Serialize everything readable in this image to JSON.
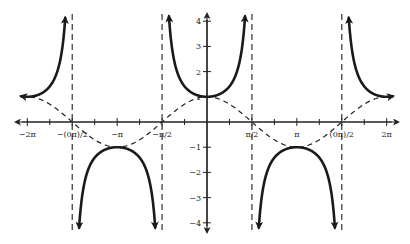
{
  "chart_data": {
    "type": "line",
    "title": "",
    "xlabel": "",
    "ylabel": "",
    "xlim": [
      -6.5,
      6.5
    ],
    "ylim": [
      -4.4,
      4.4
    ],
    "grid": false,
    "x_ticks": [
      {
        "value": -6.2832,
        "label": "−2π"
      },
      {
        "value": -4.7124,
        "label": "−(0π)/2"
      },
      {
        "value": -3.1416,
        "label": "−π"
      },
      {
        "value": -1.5708,
        "label": "−π/2"
      },
      {
        "value": 1.5708,
        "label": "π/2"
      },
      {
        "value": 3.1416,
        "label": "π"
      },
      {
        "value": 4.7124,
        "label": "(0π)/2"
      },
      {
        "value": 6.2832,
        "label": "2π"
      }
    ],
    "x_minor_ticks": [
      -5.4978,
      -3.927,
      -2.3562,
      -0.7854,
      0.7854,
      2.3562,
      3.927,
      5.4978
    ],
    "y_ticks": [
      {
        "value": 4,
        "label": "4"
      },
      {
        "value": 3,
        "label": "3"
      },
      {
        "value": 2,
        "label": "2"
      },
      {
        "value": 1,
        "label": "1"
      },
      {
        "value": -1,
        "label": "−1"
      },
      {
        "value": -2,
        "label": "−2"
      },
      {
        "value": -3,
        "label": "−3"
      },
      {
        "value": -4,
        "label": "−4"
      }
    ],
    "series": [
      {
        "name": "y = sec x",
        "style": "solid",
        "function": "sec",
        "domain": [
          -6.5,
          6.5
        ],
        "clip_y": 4.2
      },
      {
        "name": "y = cos x",
        "style": "dashed",
        "function": "cos",
        "domain": [
          -6.5,
          6.5
        ]
      }
    ],
    "asymptotes": [
      -4.7124,
      -1.5708,
      1.5708,
      4.7124
    ],
    "key_points": [
      {
        "x": -6.2832,
        "y": 1
      },
      {
        "x": -3.1416,
        "y": -1
      },
      {
        "x": 0,
        "y": 1
      },
      {
        "x": 3.1416,
        "y": -1
      },
      {
        "x": 6.2832,
        "y": 1
      }
    ]
  },
  "layout": {
    "origin_px": [
      207,
      122
    ],
    "px_per_x_unit": 28.6,
    "px_per_y_unit": 25.2,
    "x_axis_px": [
      16,
      398
    ],
    "y_axis_px": [
      14,
      232
    ]
  }
}
